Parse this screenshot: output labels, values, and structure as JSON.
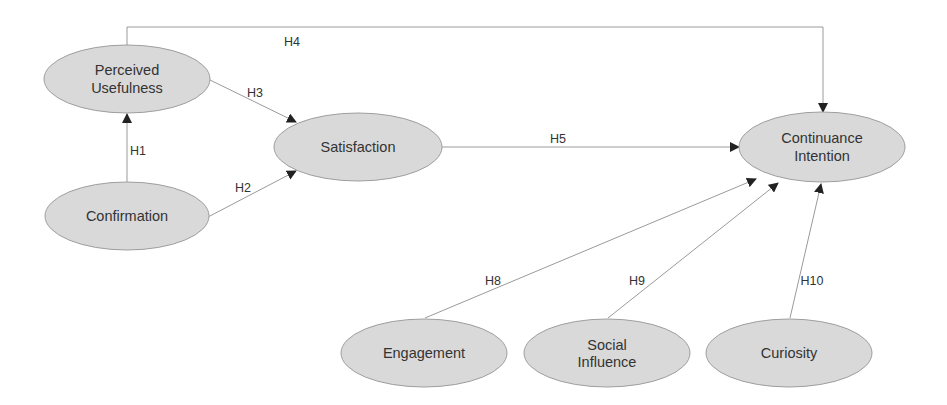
{
  "diagram": {
    "title": "",
    "colors": {
      "node_fill": "#d9d9d9",
      "node_stroke": "#9e9e9e",
      "edge": "#9a9a9a",
      "arrowhead": "#222222",
      "text": "#333333"
    },
    "nodes": [
      {
        "id": "pu",
        "line1": "Perceived",
        "line2": "Usefulness"
      },
      {
        "id": "cf",
        "line1": "Confirmation",
        "line2": ""
      },
      {
        "id": "sat",
        "line1": "Satisfaction",
        "line2": ""
      },
      {
        "id": "ci",
        "line1": "Continuance",
        "line2": "Intention"
      },
      {
        "id": "eng",
        "line1": "Engagement",
        "line2": ""
      },
      {
        "id": "si",
        "line1": "Social",
        "line2": "Influence"
      },
      {
        "id": "cur",
        "line1": "Curiosity",
        "line2": ""
      }
    ],
    "edges": [
      {
        "label": "H1",
        "from": "Confirmation",
        "to": "Perceived Usefulness"
      },
      {
        "label": "H2",
        "from": "Confirmation",
        "to": "Satisfaction"
      },
      {
        "label": "H3",
        "from": "Perceived Usefulness",
        "to": "Satisfaction"
      },
      {
        "label": "H4",
        "from": "Perceived Usefulness",
        "to": "Continuance Intention"
      },
      {
        "label": "H5",
        "from": "Satisfaction",
        "to": "Continuance Intention"
      },
      {
        "label": "H8",
        "from": "Engagement",
        "to": "Continuance Intention"
      },
      {
        "label": "H9",
        "from": "Social Influence",
        "to": "Continuance Intention"
      },
      {
        "label": "H10",
        "from": "Curiosity",
        "to": "Continuance Intention"
      }
    ]
  }
}
